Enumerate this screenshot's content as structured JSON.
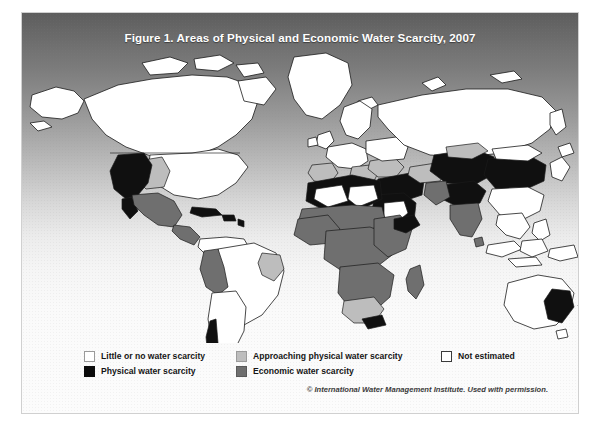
{
  "figure": {
    "title": "Figure 1. Areas of Physical and Economic Water Scarcity, 2007",
    "credit": "© International Water Management Institute. Used with permission."
  },
  "legend": {
    "items": [
      {
        "label": "Little or no water scarcity",
        "swatch": "white",
        "color": "#ffffff",
        "column": 1,
        "row": 1
      },
      {
        "label": "Physical water scarcity",
        "swatch": "black",
        "color": "#0b0b0b",
        "column": 1,
        "row": 2
      },
      {
        "label": "Approaching physical water scarcity",
        "swatch": "light",
        "color": "#bdbdbd",
        "column": 2,
        "row": 1
      },
      {
        "label": "Economic water scarcity",
        "swatch": "mid",
        "color": "#6f6f6f",
        "column": 2,
        "row": 2
      },
      {
        "label": "Not estimated",
        "swatch": "notest",
        "color": "#ffffff",
        "column": 3,
        "row": 1
      }
    ]
  },
  "map": {
    "projection": "world",
    "background_gradient_top": "#5d5d5d",
    "background_gradient_bottom": "#fcfcfc",
    "ocean_note": "gradient background, no ocean fill",
    "regions": [
      {
        "name": "Alaska",
        "category": "Little or no water scarcity"
      },
      {
        "name": "Canada",
        "category": "Little or no water scarcity"
      },
      {
        "name": "Greenland",
        "category": "Little or no water scarcity"
      },
      {
        "name": "Western United States",
        "category": "Physical water scarcity"
      },
      {
        "name": "Central United States",
        "category": "Approaching physical water scarcity"
      },
      {
        "name": "Eastern United States",
        "category": "Little or no water scarcity"
      },
      {
        "name": "Mexico",
        "category": "Economic water scarcity"
      },
      {
        "name": "Central America",
        "category": "Economic water scarcity"
      },
      {
        "name": "Caribbean",
        "category": "Physical water scarcity"
      },
      {
        "name": "Brazil",
        "category": "Little or no water scarcity"
      },
      {
        "name": "Northeast Brazil",
        "category": "Approaching physical water scarcity"
      },
      {
        "name": "Peru / Bolivia Andes",
        "category": "Economic water scarcity"
      },
      {
        "name": "Argentina / Chile",
        "category": "Little or no water scarcity"
      },
      {
        "name": "Southern Chile coast",
        "category": "Physical water scarcity"
      },
      {
        "name": "Western Europe",
        "category": "Little or no water scarcity"
      },
      {
        "name": "Southern Europe",
        "category": "Approaching physical water scarcity"
      },
      {
        "name": "Spain",
        "category": "Approaching physical water scarcity"
      },
      {
        "name": "Russia",
        "category": "Little or no water scarcity"
      },
      {
        "name": "North Africa",
        "category": "Physical water scarcity"
      },
      {
        "name": "Sahara interior",
        "category": "Not estimated"
      },
      {
        "name": "Sahel",
        "category": "Economic water scarcity"
      },
      {
        "name": "Sub-Saharan Africa",
        "category": "Economic water scarcity"
      },
      {
        "name": "South Africa",
        "category": "Approaching physical water scarcity"
      },
      {
        "name": "Madagascar",
        "category": "Economic water scarcity"
      },
      {
        "name": "Arabian Peninsula",
        "category": "Physical water scarcity"
      },
      {
        "name": "Saudi interior",
        "category": "Not estimated"
      },
      {
        "name": "Middle East",
        "category": "Physical water scarcity"
      },
      {
        "name": "Central Asia",
        "category": "Physical water scarcity"
      },
      {
        "name": "Northern India",
        "category": "Physical water scarcity"
      },
      {
        "name": "Southern India",
        "category": "Economic water scarcity"
      },
      {
        "name": "Northern China",
        "category": "Physical water scarcity"
      },
      {
        "name": "Southern China",
        "category": "Little or no water scarcity"
      },
      {
        "name": "Southeast Asia",
        "category": "Little or no water scarcity"
      },
      {
        "name": "Indonesia",
        "category": "Little or no water scarcity"
      },
      {
        "name": "Australia",
        "category": "Little or no water scarcity"
      },
      {
        "name": "Southeast Australia",
        "category": "Physical water scarcity"
      },
      {
        "name": "New Zealand",
        "category": "Little or no water scarcity"
      }
    ]
  }
}
